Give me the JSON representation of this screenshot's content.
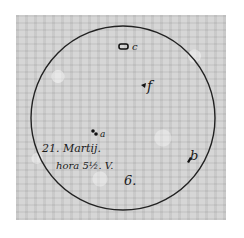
{
  "figure": {
    "caption_line1": "21. Martij.",
    "caption_line2": "hora 5½. V.",
    "plate_number": "6.",
    "spots": [
      {
        "label": "c"
      },
      {
        "label": "f"
      },
      {
        "label": "a"
      },
      {
        "label": "b"
      }
    ]
  }
}
